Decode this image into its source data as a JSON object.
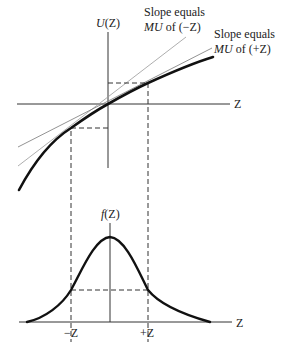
{
  "utility_panel": {
    "y_axis_label": "U(Z)",
    "x_axis_label": "Z",
    "tangent_minus": {
      "line1": "Slope equals",
      "line2_mu": "MU",
      "line2_rest": " of (−Z)"
    },
    "tangent_plus": {
      "line1": "Slope equals",
      "line2_mu": "MU",
      "line2_rest": " of (+Z)"
    }
  },
  "density_panel": {
    "y_axis_label": "f(Z)",
    "x_axis_label": "Z",
    "tick_minus": "−Z",
    "tick_plus": "+Z"
  },
  "colors": {
    "curve": "#111111",
    "axis": "#333333",
    "tangent": "#888888",
    "dashed": "#333333"
  }
}
